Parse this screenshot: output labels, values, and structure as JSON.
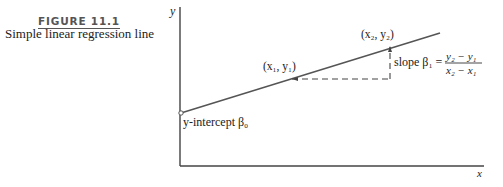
{
  "figure": {
    "number": "FIGURE 11.1",
    "title": "Simple linear regression line"
  },
  "axes": {
    "y_label": "y",
    "x_label": "x"
  },
  "points": {
    "p1_label": "(x₁, y₁)",
    "p2_label": "(x₂, y₂)"
  },
  "annotations": {
    "intercept_label": "y-intercept β₀",
    "slope_prefix": "slope β₁ =",
    "slope_numerator": "y₂ − y₁",
    "slope_denominator": "x₂ − x₁"
  },
  "colors": {
    "line": "#555555",
    "axis": "#333333"
  }
}
